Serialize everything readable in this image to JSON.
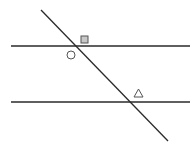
{
  "diagram": {
    "type": "parallel-lines-transversal",
    "colors": {
      "line": "#2a2a2a",
      "shape_fill": "#c8c8c8",
      "shape_stroke": "#555555"
    },
    "lines": [
      {
        "id": "parallel-1",
        "x1": 11,
        "y1": 46,
        "x2": 190,
        "y2": 46
      },
      {
        "id": "parallel-2",
        "x1": 11,
        "y1": 102,
        "x2": 190,
        "y2": 102
      },
      {
        "id": "transversal",
        "x1": 41,
        "y1": 10,
        "x2": 168,
        "y2": 141
      }
    ],
    "angle_markers": [
      {
        "shape": "square",
        "label": "square-marker",
        "x": 81,
        "y": 36,
        "size": 7
      },
      {
        "shape": "circle",
        "label": "circle-marker",
        "cx": 71,
        "cy": 55,
        "r": 4
      },
      {
        "shape": "triangle",
        "label": "triangle-marker",
        "points": "134,97 143,97 138.5,89"
      }
    ]
  }
}
